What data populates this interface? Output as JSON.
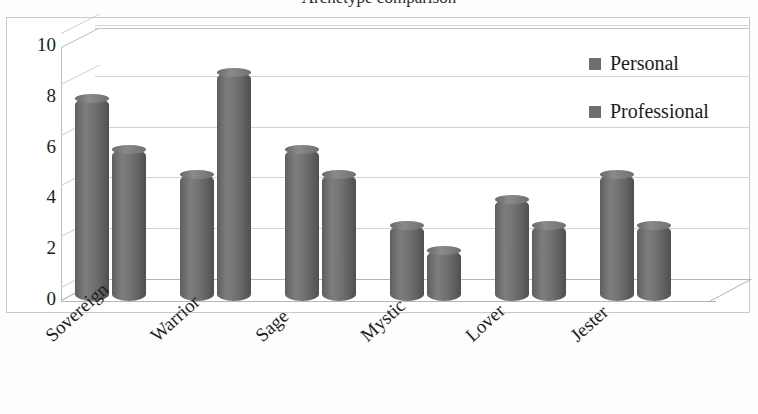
{
  "chart_data": {
    "type": "bar",
    "title": "Archetype comparison",
    "xlabel": "",
    "ylabel": "",
    "ylim": [
      0,
      10
    ],
    "yticks": [
      0,
      2,
      4,
      6,
      8,
      10
    ],
    "grid": true,
    "legend_position": "right",
    "style": "3d-cylinder-clustered",
    "categories": [
      "Sovereign",
      "Warrior",
      "Sage",
      "Mystic",
      "Lover",
      "Jester"
    ],
    "series": [
      {
        "name": "Personal",
        "color": "#6e6e6e",
        "values": [
          8,
          5,
          6,
          3,
          4,
          5
        ]
      },
      {
        "name": "Professional",
        "color": "#6e6e6e",
        "values": [
          6,
          9,
          5,
          2,
          3,
          3
        ]
      }
    ]
  },
  "colors": {
    "bar": "#6e6e6e",
    "gridline": "#d2d2d2",
    "axis": "#b5b5b5",
    "frame": "#c9c9c9",
    "text": "#1c1c1c"
  }
}
